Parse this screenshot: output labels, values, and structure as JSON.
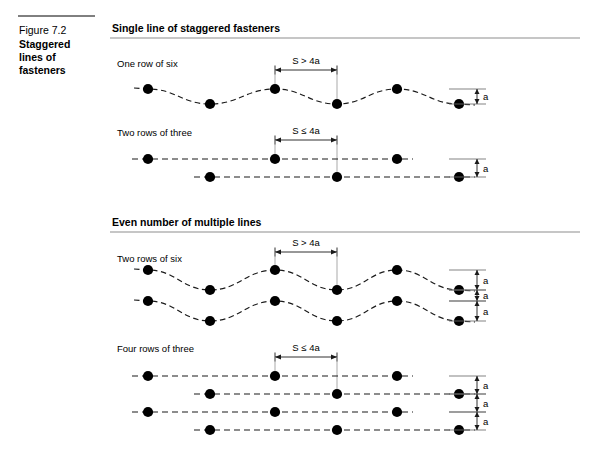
{
  "figure": {
    "number_label": "Figure 7.2",
    "title_lines": [
      "Staggered",
      "lines of",
      "fasteners"
    ]
  },
  "sections": [
    {
      "id": "single-line",
      "heading": "Single line of staggered fasteners",
      "subdiagrams": [
        {
          "id": "one-row-of-six",
          "label": "One row of six",
          "dim_label": "S > 4a",
          "a_labels": [
            "a"
          ],
          "style": "wave",
          "rows": 1,
          "dots_per_row": 6
        },
        {
          "id": "two-rows-of-three",
          "label": "Two rows of three",
          "dim_label": "S ≤ 4a",
          "a_labels": [
            "a"
          ],
          "style": "dashed-straight",
          "rows": 2,
          "dots_per_row": 3
        }
      ]
    },
    {
      "id": "even-number",
      "heading": "Even number of multiple lines",
      "subdiagrams": [
        {
          "id": "two-rows-of-six",
          "label": "Two rows of six",
          "dim_label": "S > 4a",
          "a_labels": [
            "a",
            "a",
            "a"
          ],
          "style": "wave",
          "rows": 2,
          "dots_per_row": 6
        },
        {
          "id": "four-rows-of-three",
          "label": "Four rows of three",
          "dim_label": "S ≤ 4a",
          "a_labels": [
            "a",
            "a",
            "a"
          ],
          "style": "dashed-straight",
          "rows": 4,
          "dots_per_row": 3
        }
      ]
    }
  ],
  "geometry": {
    "dot_radius": 5.1,
    "columns_upper": [
      148,
      275,
      397
    ],
    "columns_lower": [
      210,
      337,
      459
    ],
    "dim_span": [
      275,
      337
    ],
    "caption_rule": {
      "x1": 18,
      "x2": 95,
      "y": 16
    },
    "section_rule": {
      "x1": 110,
      "x2": 580
    }
  },
  "colors": {
    "ink": "#000000",
    "line": "#1a1a1a",
    "rule": "#8d8d8d",
    "background": "#ffffff"
  }
}
